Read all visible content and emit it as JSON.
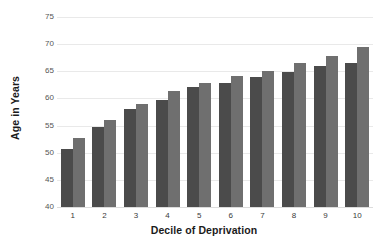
{
  "chart_data": {
    "type": "bar",
    "title": "",
    "xlabel": "Decile of Deprivation",
    "ylabel": "Age in Years",
    "categories": [
      "1",
      "2",
      "3",
      "4",
      "5",
      "6",
      "7",
      "8",
      "9",
      "10"
    ],
    "series": [
      {
        "name": "series-a",
        "color": "#4b4b4b",
        "values": [
          50.7,
          54.7,
          58.0,
          59.7,
          62.1,
          62.8,
          64.0,
          64.9,
          66.0,
          66.5
        ]
      },
      {
        "name": "series-b",
        "color": "#6f6f6f",
        "values": [
          52.7,
          56.0,
          58.9,
          61.3,
          62.9,
          64.1,
          65.1,
          66.5,
          67.8,
          69.5
        ]
      }
    ],
    "ylim": [
      40,
      75
    ],
    "ytick_labels": [
      "75",
      "70",
      "65",
      "60",
      "55",
      "50",
      "45",
      "40"
    ],
    "ytick_values": [
      75,
      70,
      65,
      60,
      55,
      50,
      45,
      40
    ],
    "grid": true,
    "legend": "none",
    "background_color": "#ffffff",
    "gridline_color": "#e9e9e9"
  }
}
